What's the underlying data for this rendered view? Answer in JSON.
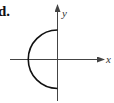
{
  "figure": {
    "label": "d.",
    "x_axis_label": "x",
    "y_axis_label": "y",
    "curve": "left semicircle centered at origin"
  },
  "colors": {
    "curve": "#111111",
    "axis": "#444444"
  }
}
